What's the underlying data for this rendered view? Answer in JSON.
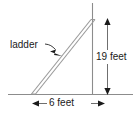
{
  "figure": {
    "background_color": "#ffffff",
    "line_color": "#8c8c8c",
    "arrow_color": "#1a1a1a",
    "text_color": "#1a1a1a",
    "labels": {
      "ladder": "ladder",
      "height": "19 feet",
      "base": "6 feet"
    },
    "icons": {
      "leader_arrow": "arrow-pointing-to-ladder",
      "height_dimension": "double-headed-vertical-arrow",
      "base_dimension": "double-headed-horizontal-arrow"
    },
    "geometry": {
      "wall_x": 92,
      "wall_top_y": 3,
      "ground_y": 94,
      "ground_left_x": 8,
      "ground_right_x": 133,
      "ladder_foot_x": 33,
      "ladder_foot_y": 94,
      "ladder_top_x": 92,
      "ladder_top_y": 20
    },
    "measurements": {
      "height_value": 19,
      "height_unit": "feet",
      "base_value": 6,
      "base_unit": "feet"
    }
  }
}
